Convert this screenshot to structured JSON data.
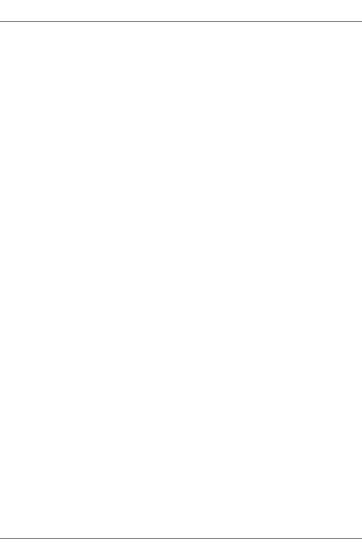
{
  "chart_data": [
    {
      "type": "line",
      "panel": "Panel A",
      "title": "Panel A",
      "xlabel": "Units of labor",
      "ylabel": "Total product",
      "x": [
        0,
        1,
        2,
        3,
        4,
        5,
        6,
        7,
        8,
        9,
        10
      ],
      "x_ticks": [
        "1",
        "2",
        "3",
        "4",
        "5",
        "6",
        "7",
        "8",
        "9",
        "10"
      ],
      "y_ticks": [
        "50",
        "100",
        "150",
        "200",
        "250",
        "300",
        "350"
      ],
      "origin_label": "O",
      "ylim": [
        0,
        370
      ],
      "xlim": [
        0,
        12
      ],
      "grid": false,
      "series": [
        {
          "name": "Total product (K̄ = 2)",
          "color": "#6b6b6b",
          "x": [
            0,
            1,
            2,
            3,
            4,
            5,
            6,
            7,
            8,
            9,
            10
          ],
          "values": [
            0,
            50,
            110,
            170,
            220,
            260,
            290,
            310,
            320,
            325,
            325
          ],
          "markers_from_index": 1
        }
      ],
      "annotations": [
        {
          "line1": "Total product",
          "line2": "(K̄ = 2)"
        }
      ]
    },
    {
      "type": "line",
      "panel": "Panel B",
      "title": "Panel B",
      "xlabel": "Units of labor",
      "ylabel": "Average and marginal products",
      "x_ticks": [
        "1",
        "2",
        "3",
        "4",
        "5",
        "6",
        "7",
        "8",
        "9",
        "10"
      ],
      "y_ticks": [
        "−10",
        "0",
        "10",
        "20",
        "30",
        "40",
        "50",
        "60"
      ],
      "ylim": [
        -15,
        70
      ],
      "xlim": [
        0,
        12
      ],
      "grid": false,
      "series": [
        {
          "name": "Average product (K̄ = 2)",
          "color": "#9a9a9a",
          "x": [
            1,
            2,
            3,
            4,
            5,
            6,
            7,
            8,
            9,
            10
          ],
          "values": [
            50,
            55,
            56.7,
            55,
            52,
            48.3,
            44.3,
            40.6,
            36.1,
            32.5
          ]
        },
        {
          "name": "Marginal product (K̄ = 2)",
          "color": "#5e5e5e",
          "x": [
            1,
            2,
            3,
            4,
            5,
            6,
            7,
            8,
            9
          ],
          "values": [
            50,
            60,
            57.5,
            47.5,
            37.5,
            28,
            19.5,
            11.5,
            4
          ]
        }
      ],
      "annotations": [
        {
          "line1": "Average product",
          "line2": "(K̄ = 2)"
        },
        {
          "line1": "Marginal",
          "line2": "product (K̄ = 2)"
        }
      ]
    }
  ]
}
